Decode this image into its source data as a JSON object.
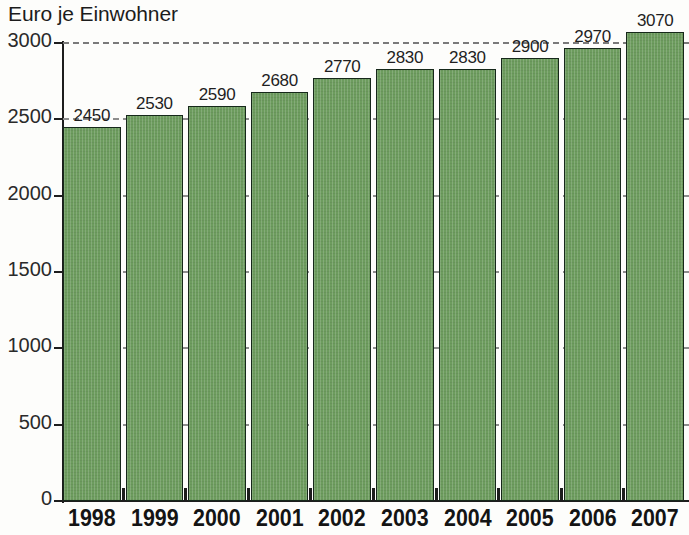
{
  "chart_data": {
    "type": "bar",
    "title": "Euro je Einwohner",
    "xlabel": "",
    "ylabel": "",
    "categories": [
      "1998",
      "1999",
      "2000",
      "2001",
      "2002",
      "2003",
      "2004",
      "2005",
      "2006",
      "2007"
    ],
    "values": [
      2450,
      2530,
      2590,
      2680,
      2770,
      2830,
      2830,
      2900,
      2970,
      3070
    ],
    "value_labels": [
      "2450",
      "2530",
      "2590",
      "2680",
      "2770",
      "2830",
      "2830",
      "2900",
      "2970",
      "3070"
    ],
    "ylim": [
      0,
      3000
    ],
    "ytick_values": [
      0,
      500,
      1000,
      1500,
      2000,
      2500,
      3000
    ],
    "ytick_labels": [
      "0",
      "500",
      "1000",
      "1500",
      "2000",
      "2500",
      "3000"
    ],
    "grid": true,
    "grid_style": "dashed",
    "legend": null,
    "series": [
      {
        "name": "Euro je Einwohner",
        "values": [
          2450,
          2530,
          2590,
          2680,
          2770,
          2830,
          2830,
          2900,
          2970,
          3070
        ],
        "color": "#6d9c5e"
      }
    ],
    "colors": {
      "bar_fill": "#6d9c5e",
      "bar_outline": "#16281a",
      "gridline": "#8d8d8d",
      "axis": "#1d1d1d",
      "text": "#1c1c1c",
      "background": "#fdfdfb"
    }
  }
}
